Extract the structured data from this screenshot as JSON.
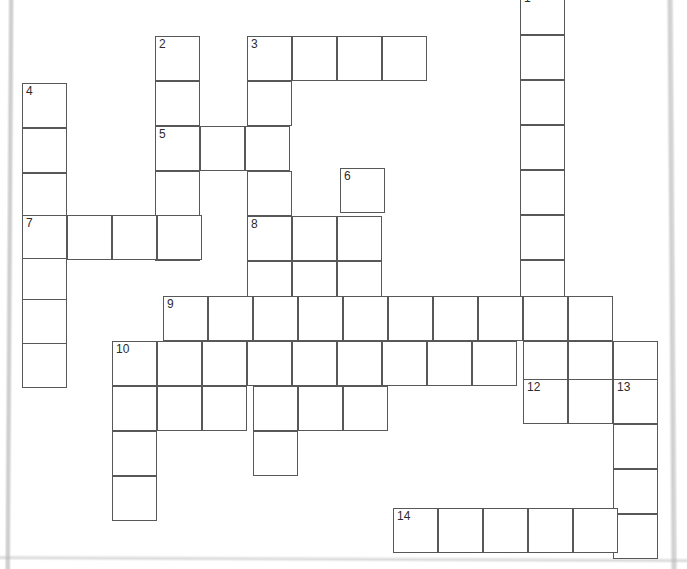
{
  "puzzle": {
    "kind": "crossword-grid",
    "cell_size": 45,
    "origin_x": 22,
    "origin_y": 0,
    "grid_cols": 15,
    "grid_rows": 13,
    "ink_color": "#56585a",
    "number_color": "#2a2c2e",
    "background": "#ffffff",
    "numbers_visible": [
      1,
      2,
      3,
      4,
      5,
      6,
      7,
      8,
      9,
      10,
      12,
      13,
      14
    ],
    "entries": [
      {
        "number": 1,
        "direction": "down",
        "col": 11,
        "row": -1,
        "length": 7
      },
      {
        "number": 2,
        "direction": "down",
        "col": 3,
        "row": 0,
        "length": 5
      },
      {
        "number": 3,
        "direction": "across",
        "col": 5,
        "row": 0,
        "length": 4
      },
      {
        "number": 3,
        "direction": "down",
        "col": 5,
        "row": 0,
        "length": 6
      },
      {
        "number": 4,
        "direction": "down",
        "col": 0,
        "row": 1,
        "length": 7
      },
      {
        "number": 5,
        "direction": "across",
        "col": 3,
        "row": 2,
        "length": 3
      },
      {
        "number": 6,
        "direction": "down",
        "col": 7,
        "row": 3,
        "length": 4
      },
      {
        "number": 7,
        "direction": "across",
        "col": 0,
        "row": 4,
        "length": 4
      },
      {
        "number": 8,
        "direction": "across",
        "col": 5,
        "row": 4,
        "length": 3
      },
      {
        "number": 8,
        "direction": "down",
        "col": 5,
        "row": 4,
        "length": 4
      },
      {
        "number": 9,
        "direction": "across",
        "col": 3,
        "row": 6,
        "length": 10
      },
      {
        "number": 10,
        "direction": "across",
        "col": 2,
        "row": 7,
        "length": 12
      },
      {
        "number": 10,
        "direction": "down",
        "col": 2,
        "row": 7,
        "length": 4
      },
      {
        "number": 12,
        "direction": "across",
        "col": 11,
        "row": 8,
        "length": 3
      },
      {
        "number": 13,
        "direction": "down",
        "col": 13,
        "row": 8,
        "length": 4
      },
      {
        "number": 14,
        "direction": "across",
        "col": 8,
        "row": 11,
        "length": 6
      }
    ],
    "cells": [
      {
        "x": 520,
        "y": -10,
        "n": "1"
      },
      {
        "x": 520,
        "y": 35
      },
      {
        "x": 520,
        "y": 80
      },
      {
        "x": 520,
        "y": 125
      },
      {
        "x": 520,
        "y": 170
      },
      {
        "x": 520,
        "y": 215
      },
      {
        "x": 520,
        "y": 260
      },
      {
        "x": 155,
        "y": 36,
        "n": "2"
      },
      {
        "x": 155,
        "y": 81
      },
      {
        "x": 155,
        "y": 126,
        "n": "5"
      },
      {
        "x": 155,
        "y": 171
      },
      {
        "x": 155,
        "y": 216
      },
      {
        "x": 200,
        "y": 126
      },
      {
        "x": 245,
        "y": 126
      },
      {
        "x": 247,
        "y": 36,
        "n": "3"
      },
      {
        "x": 292,
        "y": 36
      },
      {
        "x": 337,
        "y": 36
      },
      {
        "x": 382,
        "y": 36
      },
      {
        "x": 247,
        "y": 81
      },
      {
        "x": 247,
        "y": 171
      },
      {
        "x": 247,
        "y": 216,
        "n": "8"
      },
      {
        "x": 247,
        "y": 261
      },
      {
        "x": 22,
        "y": 83,
        "n": "4"
      },
      {
        "x": 22,
        "y": 128
      },
      {
        "x": 22,
        "y": 173
      },
      {
        "x": 22,
        "y": 215,
        "n": "7"
      },
      {
        "x": 22,
        "y": 258
      },
      {
        "x": 22,
        "y": 299
      },
      {
        "x": 22,
        "y": 343
      },
      {
        "x": 67,
        "y": 215
      },
      {
        "x": 112,
        "y": 215
      },
      {
        "x": 157,
        "y": 215
      },
      {
        "x": 292,
        "y": 216
      },
      {
        "x": 337,
        "y": 216
      },
      {
        "x": 292,
        "y": 261
      },
      {
        "x": 337,
        "y": 261
      },
      {
        "x": 340,
        "y": 168,
        "n": "6"
      },
      {
        "x": 163,
        "y": 296,
        "n": "9"
      },
      {
        "x": 208,
        "y": 296
      },
      {
        "x": 253,
        "y": 296
      },
      {
        "x": 298,
        "y": 296
      },
      {
        "x": 343,
        "y": 296
      },
      {
        "x": 388,
        "y": 296
      },
      {
        "x": 433,
        "y": 296
      },
      {
        "x": 478,
        "y": 296
      },
      {
        "x": 523,
        "y": 296
      },
      {
        "x": 568,
        "y": 296
      },
      {
        "x": 112,
        "y": 341,
        "n": "10"
      },
      {
        "x": 157,
        "y": 341
      },
      {
        "x": 202,
        "y": 341
      },
      {
        "x": 247,
        "y": 341
      },
      {
        "x": 292,
        "y": 341
      },
      {
        "x": 337,
        "y": 341
      },
      {
        "x": 382,
        "y": 341
      },
      {
        "x": 427,
        "y": 341
      },
      {
        "x": 472,
        "y": 341
      },
      {
        "x": 523,
        "y": 341
      },
      {
        "x": 568,
        "y": 341
      },
      {
        "x": 613,
        "y": 341
      },
      {
        "x": 112,
        "y": 386
      },
      {
        "x": 157,
        "y": 386
      },
      {
        "x": 202,
        "y": 386
      },
      {
        "x": 253,
        "y": 386
      },
      {
        "x": 298,
        "y": 386
      },
      {
        "x": 343,
        "y": 386
      },
      {
        "x": 112,
        "y": 431
      },
      {
        "x": 112,
        "y": 476
      },
      {
        "x": 253,
        "y": 431
      },
      {
        "x": 523,
        "y": 379,
        "n": "12"
      },
      {
        "x": 568,
        "y": 379
      },
      {
        "x": 613,
        "y": 379,
        "n": "13"
      },
      {
        "x": 613,
        "y": 424
      },
      {
        "x": 613,
        "y": 469
      },
      {
        "x": 613,
        "y": 514
      },
      {
        "x": 393,
        "y": 508,
        "n": "14"
      },
      {
        "x": 438,
        "y": 508
      },
      {
        "x": 483,
        "y": 508
      },
      {
        "x": 528,
        "y": 508
      },
      {
        "x": 573,
        "y": 508
      }
    ]
  }
}
